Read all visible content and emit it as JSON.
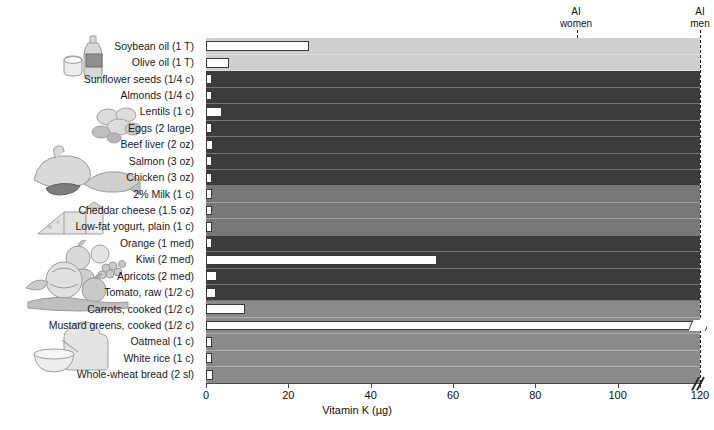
{
  "chart_data": {
    "type": "bar",
    "orientation": "horizontal",
    "title": "",
    "xlabel": "Vitamin K (µg)",
    "ylabel": "",
    "xlim": [
      0,
      120
    ],
    "xticks": [
      0,
      20,
      40,
      60,
      80,
      100,
      120
    ],
    "xticklabels": [
      "0",
      "20",
      "40",
      "60",
      "80",
      "100",
      "120"
    ],
    "grid": false,
    "legend": "none",
    "axis_break": true,
    "axis_break_note": "x-axis broken just past 120",
    "categories": [
      "Soybean oil (1 T)",
      "Olive oil (1 T)",
      "Sunflower seeds (1/4 c)",
      "Almonds (1/4 c)",
      "Lentils (1 c)",
      "Eggs (2 large)",
      "Beef liver (2 oz)",
      "Salmon (3 oz)",
      "Chicken (3 oz)",
      "2% Milk (1 c)",
      "Cheddar cheese (1.5 oz)",
      "Low-fat yogurt, plain (1 c)",
      "Orange (1 med)",
      "Kiwi (2 med)",
      "Apricots (2 med)",
      "Tomato, raw (1/2 c)",
      "Carrots, cooked (1/2 c)",
      "Mustard greens, cooked (1/2 c)",
      "Oatmeal (1 c)",
      "White rice (1 c)",
      "Whole-wheat bread (2 sl)"
    ],
    "values": [
      25,
      5.5,
      1.2,
      1.0,
      3.8,
      0.5,
      1.6,
      0.9,
      0.4,
      0.8,
      1.4,
      0.4,
      0.4,
      56,
      2.6,
      2.4,
      9.5,
      125,
      0.9,
      0.2,
      1.6
    ],
    "values_note": "Mustard greens exceeds the axis break (drawn clipped past 120)",
    "reference_lines": [
      {
        "label_line1": "AI",
        "label_line2": "women",
        "value": 90
      },
      {
        "label_line1": "AI",
        "label_line2": "men",
        "value": 120
      }
    ],
    "groups": [
      {
        "name": "oils",
        "rows": [
          0,
          1
        ],
        "color": "#cfcfcf"
      },
      {
        "name": "protein-foods",
        "rows": [
          2,
          8
        ],
        "color": "#3c3c3c"
      },
      {
        "name": "dairy",
        "rows": [
          9,
          11
        ],
        "color": "#777777"
      },
      {
        "name": "fruits",
        "rows": [
          12,
          15
        ],
        "color": "#3c3c3c"
      },
      {
        "name": "vegetables-and-grains",
        "rows": [
          16,
          20
        ],
        "color": "#8a8a8a"
      }
    ],
    "bar_color": "#ffffff",
    "bar_outline": "#3a3a3a"
  },
  "axis": {
    "title": "Vitamin K (µg)",
    "ticks": [
      "0",
      "20",
      "40",
      "60",
      "80",
      "100",
      "120"
    ]
  },
  "reference": {
    "women": {
      "line1": "AI",
      "line2": "women"
    },
    "men": {
      "line1": "AI",
      "line2": "men"
    }
  },
  "illustrations": [
    {
      "name": "oil-bottle-and-butter",
      "alt": "bottle of oil with cup"
    },
    {
      "name": "nuts-and-legumes",
      "alt": "almonds and lentils"
    },
    {
      "name": "meat-poultry-fish",
      "alt": "roast chicken, steak and salmon"
    },
    {
      "name": "cheese-and-milk",
      "alt": "cheese wedges and milk carton"
    },
    {
      "name": "assorted-fruit",
      "alt": "apple, kiwi, berries"
    },
    {
      "name": "vegetables",
      "alt": "lettuce, carrot, tomato on board"
    },
    {
      "name": "grains",
      "alt": "bread slices and bowl of oatmeal"
    }
  ]
}
